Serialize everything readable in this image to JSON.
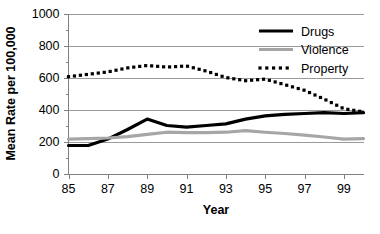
{
  "chart_data": {
    "type": "line",
    "title": "",
    "xlabel": "Year",
    "ylabel": "Mean Rate per 100,000",
    "xlim": [
      85,
      100
    ],
    "ylim": [
      0,
      1000
    ],
    "grid": true,
    "legend_position": "top-right",
    "x": [
      85,
      86,
      87,
      88,
      89,
      90,
      91,
      92,
      93,
      94,
      95,
      96,
      97,
      98,
      99,
      100
    ],
    "xtick_labels": [
      "85",
      "87",
      "89",
      "91",
      "93",
      "95",
      "97",
      "99"
    ],
    "xtick_values": [
      85,
      87,
      89,
      91,
      93,
      95,
      97,
      99
    ],
    "ytick_labels": [
      "0",
      "200",
      "400",
      "600",
      "800",
      "1000"
    ],
    "ytick_values": [
      0,
      200,
      400,
      600,
      800,
      1000
    ],
    "yminor_values": [
      100,
      300,
      500,
      700,
      900
    ],
    "series": [
      {
        "name": "Drugs",
        "style": "solid",
        "color": "#000000",
        "width": 3.2,
        "values": [
          175,
          175,
          215,
          275,
          340,
          300,
          290,
          300,
          310,
          340,
          360,
          370,
          375,
          380,
          375,
          380
        ]
      },
      {
        "name": "Violence",
        "style": "solid",
        "color": "#a6a6a6",
        "width": 3.2,
        "values": [
          215,
          218,
          222,
          230,
          245,
          258,
          255,
          255,
          258,
          268,
          258,
          250,
          240,
          228,
          215,
          218
        ]
      },
      {
        "name": "Property",
        "style": "dotted",
        "color": "#000000",
        "width": 3.2,
        "values": [
          605,
          620,
          635,
          660,
          675,
          665,
          672,
          640,
          600,
          580,
          590,
          555,
          520,
          465,
          405,
          385
        ]
      }
    ]
  },
  "legend": {
    "items": [
      {
        "label": "Drugs"
      },
      {
        "label": "Violence"
      },
      {
        "label": "Property"
      }
    ]
  }
}
